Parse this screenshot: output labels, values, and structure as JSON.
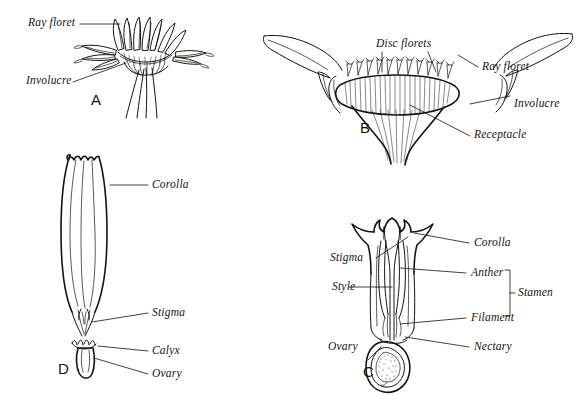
{
  "figure": {
    "background_color": "#ffffff",
    "ink_color": "#15130f",
    "width": 583,
    "height": 406
  },
  "panels": [
    {
      "id": "A",
      "letter": "A",
      "subject": "capitulum-side-view",
      "labels": [
        {
          "key": "ray_floret",
          "text": "Ray floret"
        },
        {
          "key": "involucre",
          "text": "Involucre"
        }
      ]
    },
    {
      "id": "B",
      "letter": "B",
      "subject": "capitulum-longitudinal-section",
      "labels": [
        {
          "key": "disc_florets",
          "text": "Disc florets"
        },
        {
          "key": "ray_floret",
          "text": "Ray floret"
        },
        {
          "key": "involucre",
          "text": "Involucre"
        },
        {
          "key": "receptacle",
          "text": "Receptacle"
        }
      ]
    },
    {
      "id": "C",
      "letter": "C",
      "subject": "disc-floret-section",
      "labels": [
        {
          "key": "stigma",
          "text": "Stigma"
        },
        {
          "key": "style",
          "text": "Style"
        },
        {
          "key": "ovary",
          "text": "Ovary"
        },
        {
          "key": "corolla",
          "text": "Corolla"
        },
        {
          "key": "anther",
          "text": "Anther"
        },
        {
          "key": "filament",
          "text": "Filament"
        },
        {
          "key": "nectary",
          "text": "Nectary"
        },
        {
          "key": "stamen",
          "text": "Stamen"
        }
      ]
    },
    {
      "id": "D",
      "letter": "D",
      "subject": "ray-floret-whole",
      "labels": [
        {
          "key": "corolla",
          "text": "Corolla"
        },
        {
          "key": "stigma",
          "text": "Stigma"
        },
        {
          "key": "calyx",
          "text": "Calyx"
        },
        {
          "key": "ovary",
          "text": "Ovary"
        }
      ]
    }
  ]
}
